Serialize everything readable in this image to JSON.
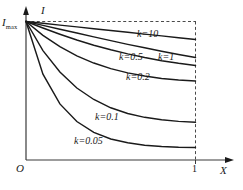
{
  "chart_data": {
    "type": "line",
    "title": "",
    "xlabel": "X",
    "ylabel": "I",
    "xlim": [
      0,
      1.18
    ],
    "ylim": [
      0,
      1.08
    ],
    "grid": false,
    "legend_position": "inline-curve-labels",
    "x_tick_labels": [
      "1"
    ],
    "x_tick_values": [
      1
    ],
    "y_tick_labels": [
      "Imax"
    ],
    "y_tick_values": [
      1
    ],
    "origin_label": "O",
    "annotations": [
      "Dashed horizontal boundary at I = Imax",
      "Dashed vertical boundary at X = 1"
    ],
    "series": [
      {
        "name": "k=10",
        "label": "k=10",
        "k": 10,
        "x": [
          0,
          0.1,
          0.2,
          0.3,
          0.4,
          0.5,
          0.6,
          0.7,
          0.8,
          0.9,
          1.0
        ],
        "values": [
          1.0,
          0.987,
          0.974,
          0.961,
          0.948,
          0.935,
          0.922,
          0.909,
          0.896,
          0.883,
          0.87
        ]
      },
      {
        "name": "k=1",
        "label": "k=1",
        "k": 1,
        "x": [
          0,
          0.1,
          0.2,
          0.3,
          0.4,
          0.5,
          0.6,
          0.7,
          0.8,
          0.9,
          1.0
        ],
        "values": [
          1.0,
          0.972,
          0.944,
          0.917,
          0.889,
          0.862,
          0.835,
          0.81,
          0.785,
          0.762,
          0.74
        ]
      },
      {
        "name": "k=0.5",
        "label": "k=0.5",
        "k": 0.5,
        "x": [
          0,
          0.1,
          0.2,
          0.3,
          0.4,
          0.5,
          0.6,
          0.7,
          0.8,
          0.9,
          1.0
        ],
        "values": [
          1.0,
          0.953,
          0.908,
          0.866,
          0.829,
          0.796,
          0.766,
          0.74,
          0.717,
          0.698,
          0.682
        ]
      },
      {
        "name": "k=0.2",
        "label": "k=0.2",
        "k": 0.2,
        "x": [
          0,
          0.1,
          0.2,
          0.3,
          0.4,
          0.5,
          0.6,
          0.7,
          0.8,
          0.9,
          1.0
        ],
        "values": [
          1.0,
          0.9,
          0.818,
          0.752,
          0.7,
          0.66,
          0.629,
          0.606,
          0.589,
          0.578,
          0.571
        ]
      },
      {
        "name": "k=0.1",
        "label": "k=0.1",
        "k": 0.1,
        "x": [
          0,
          0.1,
          0.2,
          0.3,
          0.4,
          0.5,
          0.6,
          0.7,
          0.8,
          0.9,
          1.0
        ],
        "values": [
          1.0,
          0.79,
          0.635,
          0.52,
          0.437,
          0.377,
          0.336,
          0.308,
          0.29,
          0.279,
          0.273
        ]
      },
      {
        "name": "k=0.05",
        "label": "k=0.05",
        "k": 0.05,
        "x": [
          0,
          0.1,
          0.2,
          0.3,
          0.4,
          0.5,
          0.6,
          0.7,
          0.8,
          0.9,
          1.0
        ],
        "values": [
          1.0,
          0.62,
          0.405,
          0.278,
          0.2,
          0.152,
          0.124,
          0.107,
          0.097,
          0.092,
          0.09
        ]
      }
    ]
  },
  "axes": {
    "y_axis_label": "I",
    "x_axis_label": "X",
    "origin": "O",
    "y_max_label": "I",
    "y_max_sub": "max",
    "x_tick_one": "1"
  },
  "curve_labels": [
    {
      "text": "k=10",
      "id": "curve-label-k10"
    },
    {
      "text": "k=0.5",
      "id": "curve-label-k05"
    },
    {
      "text": "k=1",
      "id": "curve-label-k1"
    },
    {
      "text": "k=0.2",
      "id": "curve-label-k02"
    },
    {
      "text": "k=0.1",
      "id": "curve-label-k01"
    },
    {
      "text": "k=0.05",
      "id": "curve-label-k005"
    }
  ],
  "colors": {
    "line": "#1a1a1a",
    "axis": "#3a3a3a",
    "dashed": "#4a4a4a",
    "background": "#ffffff"
  }
}
